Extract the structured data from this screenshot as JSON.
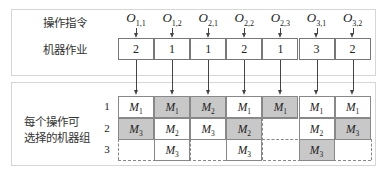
{
  "top_panel": {
    "row_label_ops": "操作指令",
    "row_label_machine": "机器作业",
    "operations": [
      {
        "symbol": "O",
        "sub": "1,1",
        "machine_assign": "2"
      },
      {
        "symbol": "O",
        "sub": "1,2",
        "machine_assign": "1"
      },
      {
        "symbol": "O",
        "sub": "2,1",
        "machine_assign": "1"
      },
      {
        "symbol": "O",
        "sub": "2,2",
        "machine_assign": "2"
      },
      {
        "symbol": "O",
        "sub": "2,3",
        "machine_assign": "1"
      },
      {
        "symbol": "O",
        "sub": "3,1",
        "machine_assign": "3"
      },
      {
        "symbol": "O",
        "sub": "3,2",
        "machine_assign": "2"
      }
    ]
  },
  "bottom_panel": {
    "label_line1": "每个操作可",
    "label_line2": "选择的机器组",
    "row_numbers": [
      "1",
      "2",
      "3"
    ],
    "grid": [
      [
        {
          "m": "M",
          "sub": "1",
          "shaded": false
        },
        {
          "m": "M",
          "sub": "1",
          "shaded": true
        },
        {
          "m": "M",
          "sub": "2",
          "shaded": true
        },
        {
          "m": "M",
          "sub": "1",
          "shaded": false
        },
        {
          "m": "M",
          "sub": "1",
          "shaded": true
        },
        {
          "m": "M",
          "sub": "1",
          "shaded": false
        },
        {
          "m": "M",
          "sub": "1",
          "shaded": false
        }
      ],
      [
        {
          "m": "M",
          "sub": "3",
          "shaded": true
        },
        {
          "m": "M",
          "sub": "2",
          "shaded": false
        },
        {
          "m": "M",
          "sub": "3",
          "shaded": false
        },
        {
          "m": "M",
          "sub": "2",
          "shaded": true
        },
        null,
        {
          "m": "M",
          "sub": "2",
          "shaded": false
        },
        {
          "m": "M",
          "sub": "3",
          "shaded": true
        }
      ],
      [
        null,
        {
          "m": "M",
          "sub": "3",
          "shaded": false
        },
        null,
        {
          "m": "M",
          "sub": "3",
          "shaded": false
        },
        null,
        {
          "m": "M",
          "sub": "3",
          "shaded": true
        },
        null
      ]
    ]
  },
  "colors": {
    "shaded": "#c8c8c8",
    "border": "#888888",
    "panel_border": "#d6d6d6"
  }
}
